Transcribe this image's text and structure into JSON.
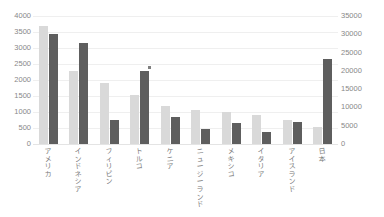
{
  "chart_data": {
    "type": "bar",
    "title": "",
    "xlabel": "",
    "ylabel": "",
    "grid": true,
    "legend_position": "none",
    "categories": [
      "アメリカ",
      "インドネシア",
      "フィリピン",
      "トルコ",
      "ケニア",
      "ニュージーランド",
      "メキシコ",
      "イタリア",
      "アイスランド",
      "日本"
    ],
    "series": [
      {
        "name": "series-1",
        "axis": "left",
        "color": "#d9d9d9",
        "values": [
          3700,
          2280,
          1900,
          1540,
          1190,
          1060,
          1000,
          910,
          740,
          540
        ]
      },
      {
        "name": "series-2",
        "axis": "right",
        "color": "#5e5e5e",
        "values": [
          30000,
          27700,
          6700,
          20000,
          7400,
          4000,
          5800,
          3400,
          6000,
          23200
        ]
      }
    ],
    "left_axis": {
      "min": 0,
      "max": 4000,
      "step": 500,
      "ticks": [
        "4000",
        "3500",
        "3000",
        "2500",
        "2000",
        "1500",
        "1000",
        "500",
        "0"
      ]
    },
    "right_axis": {
      "min": 0,
      "max": 35000,
      "step": 5000,
      "ticks": [
        "35000",
        "30000",
        "25000",
        "20000",
        "15000",
        "10000",
        "5000",
        "0"
      ]
    },
    "annotations": [
      {
        "name": "turkey-point-marker",
        "category": "トルコ",
        "series": "series-2",
        "value": 21000,
        "shape": "square"
      }
    ]
  }
}
